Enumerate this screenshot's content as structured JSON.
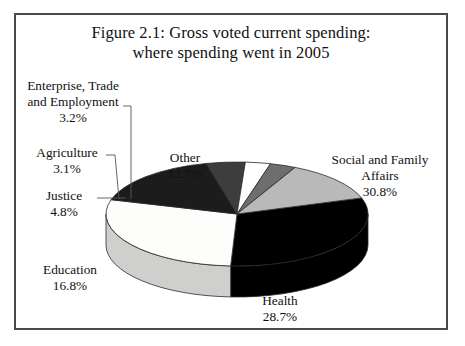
{
  "figure": {
    "title_line1": "Figure 2.1: Gross voted current spending:",
    "title_line2": "where spending went in 2005"
  },
  "chart_data": {
    "type": "pie",
    "title": "Figure 2.1: Gross voted current spending: where spending went in 2005",
    "xlabel": "",
    "ylabel": "",
    "units": "percent",
    "legend_position": "none",
    "labels_outside": true,
    "three_d": true,
    "categories": [
      "Social and Family Affairs",
      "Health",
      "Education",
      "Justice",
      "Agriculture",
      "Enterprise, Trade and Employment",
      "Other"
    ],
    "values": [
      30.8,
      28.7,
      16.8,
      4.8,
      3.1,
      3.2,
      12.7
    ],
    "value_labels": [
      "30.8%",
      "28.7%",
      "16.8%",
      "4.8%",
      "3.1%",
      "3.2%",
      "12.7%"
    ],
    "slice_colors": [
      "#000000",
      "#fdfdfb",
      "#1c1c1c",
      "#3d3d3d",
      "#ffffff",
      "#6e6e6e",
      "#b9b9b9"
    ],
    "slices": [
      {
        "name": "Social and Family Affairs",
        "value": 30.8,
        "label": "Social and Family",
        "label2": "Affairs",
        "value_label": "30.8%",
        "color": "#000000"
      },
      {
        "name": "Health",
        "value": 28.7,
        "label": "Health",
        "value_label": "28.7%",
        "color": "#fdfdfb"
      },
      {
        "name": "Education",
        "value": 16.8,
        "label": "Education",
        "value_label": "16.8%",
        "color": "#1c1c1c"
      },
      {
        "name": "Justice",
        "value": 4.8,
        "label": "Justice",
        "value_label": "4.8%",
        "color": "#3d3d3d"
      },
      {
        "name": "Agriculture",
        "value": 3.1,
        "label": "Agriculture",
        "value_label": "3.1%",
        "color": "#ffffff"
      },
      {
        "name": "Enterprise, Trade and Employment",
        "value": 3.2,
        "label": "Enterprise, Trade",
        "label2": "and Employment",
        "value_label": "3.2%",
        "color": "#6e6e6e"
      },
      {
        "name": "Other",
        "value": 12.7,
        "label": "Other",
        "value_label": "12.7%",
        "color": "#b9b9b9"
      }
    ]
  },
  "labels": {
    "social": {
      "l1": "Social and Family",
      "l2": "Affairs",
      "v": "30.8%"
    },
    "health": {
      "l1": "Health",
      "v": "28.7%"
    },
    "education": {
      "l1": "Education",
      "v": "16.8%"
    },
    "justice": {
      "l1": "Justice",
      "v": "4.8%"
    },
    "agriculture": {
      "l1": "Agriculture",
      "v": "3.1%"
    },
    "enterprise": {
      "l1": "Enterprise, Trade",
      "l2": "and Employment",
      "v": "3.2%"
    },
    "other": {
      "l1": "Other",
      "v": "12.7%"
    }
  }
}
